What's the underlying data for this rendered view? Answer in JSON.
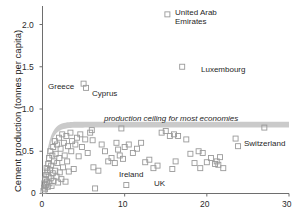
{
  "chart_data": {
    "type": "scatter",
    "title": "",
    "xlabel": "",
    "ylabel": "Cement production (tonnes per capita)",
    "xlim": [
      0,
      30
    ],
    "ylim": [
      0,
      2.25
    ],
    "xticks": [
      0,
      10,
      20,
      30
    ],
    "xtick_labels": [
      "0",
      "10",
      "20",
      "30"
    ],
    "yticks": [
      0,
      0.5,
      1.0,
      1.5,
      2.0
    ],
    "ytick_labels": [
      "0",
      "0.5",
      "1.0",
      "1.5",
      "2.0"
    ],
    "grid": false,
    "legend": false,
    "marker": "open-square",
    "marker_color": "#9a9a9a",
    "points": [
      [
        0.12,
        0.03
      ],
      [
        0.18,
        0.07
      ],
      [
        0.22,
        0.12
      ],
      [
        0.3,
        0.05
      ],
      [
        0.35,
        0.17
      ],
      [
        0.4,
        0.1
      ],
      [
        0.45,
        0.22
      ],
      [
        0.5,
        0.3
      ],
      [
        0.55,
        0.14
      ],
      [
        0.6,
        0.26
      ],
      [
        0.65,
        0.08
      ],
      [
        0.7,
        0.35
      ],
      [
        0.75,
        0.2
      ],
      [
        0.8,
        0.42
      ],
      [
        0.85,
        0.12
      ],
      [
        0.9,
        0.28
      ],
      [
        0.95,
        0.5
      ],
      [
        1.0,
        0.18
      ],
      [
        1.05,
        0.33
      ],
      [
        1.1,
        0.09
      ],
      [
        1.2,
        0.45
      ],
      [
        1.25,
        0.24
      ],
      [
        1.3,
        0.55
      ],
      [
        1.35,
        0.15
      ],
      [
        1.4,
        0.38
      ],
      [
        1.5,
        0.62
      ],
      [
        1.55,
        0.27
      ],
      [
        1.6,
        0.47
      ],
      [
        1.7,
        0.2
      ],
      [
        1.75,
        0.58
      ],
      [
        1.8,
        0.36
      ],
      [
        1.9,
        0.13
      ],
      [
        2.0,
        0.66
      ],
      [
        2.05,
        0.42
      ],
      [
        2.1,
        0.25
      ],
      [
        2.2,
        0.53
      ],
      [
        2.3,
        0.17
      ],
      [
        2.4,
        0.7
      ],
      [
        2.5,
        0.31
      ],
      [
        2.6,
        0.6
      ],
      [
        2.7,
        0.45
      ],
      [
        2.8,
        0.14
      ],
      [
        2.9,
        0.68
      ],
      [
        3.0,
        0.38
      ],
      [
        3.1,
        0.56
      ],
      [
        3.2,
        0.26
      ],
      [
        3.4,
        0.72
      ],
      [
        3.5,
        0.5
      ],
      [
        3.6,
        0.62
      ],
      [
        3.8,
        0.29
      ],
      [
        4.0,
        0.58
      ],
      [
        4.2,
        0.66
      ],
      [
        4.4,
        0.44
      ],
      [
        4.6,
        0.7
      ],
      [
        4.8,
        0.55
      ],
      [
        5.0,
        1.3
      ],
      [
        5.3,
        1.25
      ],
      [
        5.2,
        0.64
      ],
      [
        5.5,
        0.48
      ],
      [
        5.8,
        0.72
      ],
      [
        6.0,
        0.75
      ],
      [
        6.1,
        0.63
      ],
      [
        6.2,
        0.31
      ],
      [
        6.4,
        0.06
      ],
      [
        6.8,
        0.27
      ],
      [
        7.2,
        0.58
      ],
      [
        7.6,
        0.5
      ],
      [
        8.0,
        0.38
      ],
      [
        8.4,
        0.42
      ],
      [
        8.8,
        0.36
      ],
      [
        9.0,
        0.6
      ],
      [
        9.2,
        0.52
      ],
      [
        9.4,
        0.45
      ],
      [
        9.6,
        0.77
      ],
      [
        9.8,
        0.41
      ],
      [
        10.0,
        0.55
      ],
      [
        10.2,
        0.1
      ],
      [
        10.5,
        0.58
      ],
      [
        11.0,
        0.48
      ],
      [
        11.5,
        0.53
      ],
      [
        12.0,
        0.6
      ],
      [
        12.5,
        0.37
      ],
      [
        13.0,
        0.4
      ],
      [
        13.5,
        0.3
      ],
      [
        14.0,
        0.33
      ],
      [
        14.5,
        0.72
      ],
      [
        15.0,
        0.74
      ],
      [
        15.2,
        2.12
      ],
      [
        15.5,
        0.68
      ],
      [
        15.8,
        0.29
      ],
      [
        16.0,
        0.7
      ],
      [
        16.2,
        0.38
      ],
      [
        16.5,
        0.68
      ],
      [
        17.0,
        1.5
      ],
      [
        17.5,
        0.64
      ],
      [
        18.0,
        0.47
      ],
      [
        18.5,
        0.36
      ],
      [
        19.0,
        0.5
      ],
      [
        19.2,
        0.3
      ],
      [
        19.5,
        0.48
      ],
      [
        20.0,
        0.37
      ],
      [
        20.5,
        0.42
      ],
      [
        21.0,
        0.35
      ],
      [
        21.2,
        0.38
      ],
      [
        21.4,
        0.34
      ],
      [
        21.6,
        0.43
      ],
      [
        22.0,
        0.3
      ],
      [
        23.5,
        0.65
      ],
      [
        23.8,
        0.56
      ],
      [
        27.0,
        0.78
      ]
    ],
    "annotations": [
      {
        "name": "united-arab-emirates",
        "label": "United Arab\nEmirates",
        "x": 15.2,
        "y": 2.12
      },
      {
        "name": "luxembourg",
        "label": "Luxembourg",
        "x": 17.0,
        "y": 1.5
      },
      {
        "name": "greece",
        "label": "Greece",
        "x": 5.0,
        "y": 1.3
      },
      {
        "name": "cyprus",
        "label": "Cyprus",
        "x": 5.3,
        "y": 1.25
      },
      {
        "name": "switzerland",
        "label": "Switzerland",
        "x": 27.0,
        "y": 0.78
      },
      {
        "name": "ireland",
        "label": "Ireland",
        "x": 8.4,
        "y": 0.42
      },
      {
        "name": "uk",
        "label": "UK",
        "x": 13.0,
        "y": 0.4
      }
    ],
    "band": {
      "label": "production ceiling for most economies",
      "plateau_upper": 0.85,
      "plateau_lower": 0.78,
      "color": "#b5b5b5"
    }
  },
  "labels": {
    "ylabel": "Cement production (tonnes per capita)",
    "ceiling_text": "production ceiling for most economies",
    "uae_line1": "United Arab",
    "uae_line2": "Emirates",
    "luxembourg": "Luxembourg",
    "greece": "Greece",
    "cyprus": "Cyprus",
    "switzerland": "Switzerland",
    "ireland": "Ireland",
    "uk": "UK",
    "ytick0": "0",
    "ytick1": "0.5",
    "ytick2": "1.0",
    "ytick3": "1.5",
    "ytick4": "2.0",
    "xtick0": "0",
    "xtick1": "10",
    "xtick2": "20",
    "xtick3": "30"
  }
}
